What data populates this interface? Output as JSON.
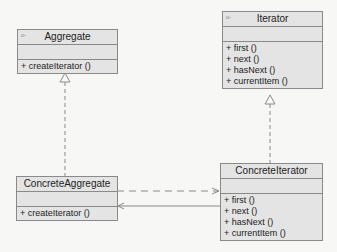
{
  "diagram": {
    "type": "UML class diagram",
    "classes": [
      {
        "name": "Aggregate",
        "stereotype_icon": "o-",
        "operations": [
          "+ createIterator ()"
        ]
      },
      {
        "name": "Iterator",
        "stereotype_icon": "o-",
        "operations": [
          "+ first ()",
          "+ next ()",
          "+ hasNext ()",
          "+ currentItem ()"
        ]
      },
      {
        "name": "ConcreteAggregate",
        "operations": [
          "+ createIterator ()"
        ]
      },
      {
        "name": "ConcreteIterator",
        "operations": [
          "+ first ()",
          "+ next ()",
          "+ hasNext ()",
          "+ currentItem ()"
        ]
      }
    ],
    "relationships": [
      {
        "from": "ConcreteAggregate",
        "to": "Aggregate",
        "kind": "realization"
      },
      {
        "from": "ConcreteIterator",
        "to": "Iterator",
        "kind": "realization"
      },
      {
        "from": "ConcreteAggregate",
        "to": "ConcreteIterator",
        "kind": "dependency"
      },
      {
        "from": "ConcreteIterator",
        "to": "ConcreteAggregate",
        "kind": "association"
      }
    ]
  },
  "colors": {
    "box_fill": "#e4e4e4",
    "box_border": "#8a8a8a",
    "line": "#8a8a8a",
    "background": "#f7f7f5"
  }
}
